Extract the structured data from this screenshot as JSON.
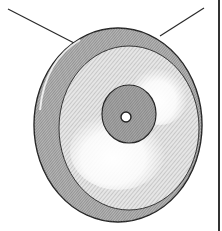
{
  "illustration": {
    "subject": "gong",
    "description": "Hand-drawn hatched illustration of a hanging gong with central boss",
    "colors": {
      "ink": "#2a2a2a",
      "hatch": "#7a7a7a",
      "rim_shade": "#9a9a9a",
      "face_light": "#f4f4f4",
      "boss_shade": "#a8a8a8",
      "background": "#ffffff"
    }
  }
}
